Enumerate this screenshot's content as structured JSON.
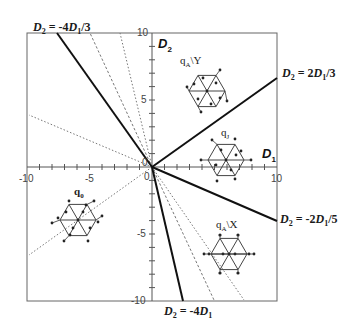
{
  "diagram": {
    "x_axis": {
      "name": "D",
      "sub": "1",
      "min": -10,
      "max": 10,
      "ticks": [
        "-10",
        "-5",
        "0",
        "10"
      ]
    },
    "y_axis": {
      "name": "D",
      "sub": "2",
      "min": -10,
      "max": 10,
      "ticks": [
        "10",
        "5",
        "0",
        "-5",
        "-10"
      ]
    },
    "boundary_lines": [
      {
        "id": "line-neg4-3",
        "label_pre": "D",
        "label_sub": "2",
        "label_mid": " = -4",
        "label_d": "D",
        "label_dsub": "1",
        "label_post": "/3",
        "slope": -1.3333,
        "style": "solid"
      },
      {
        "id": "line-2-3",
        "label_pre": "D",
        "label_sub": "2",
        "label_mid": " = 2",
        "label_d": "D",
        "label_dsub": "1",
        "label_post": "/3",
        "slope": 0.6667,
        "style": "solid"
      },
      {
        "id": "line-neg2-5",
        "label_pre": "D",
        "label_sub": "2",
        "label_mid": " = -2",
        "label_d": "D",
        "label_dsub": "1",
        "label_post": "/5",
        "slope": -0.4,
        "style": "solid"
      },
      {
        "id": "line-neg4",
        "label_pre": "D",
        "label_sub": "2",
        "label_mid": " = -4",
        "label_d": "D",
        "label_dsub": "1",
        "label_post": "",
        "slope": -4,
        "style": "solid"
      }
    ],
    "auxiliary_lines": [
      {
        "style": "dotted",
        "direction": "upper-left"
      },
      {
        "style": "dotted",
        "direction": "upper-left-steep"
      },
      {
        "style": "dashed",
        "direction": "upper-left-steep"
      },
      {
        "style": "dashed",
        "direction": "lower-right"
      },
      {
        "style": "dotted",
        "direction": "lower-right"
      },
      {
        "style": "dotted",
        "direction": "lower-left"
      }
    ],
    "regions": [
      {
        "id": "qA-Y",
        "label_main": "q",
        "label_sub": "A",
        "label_suffix": "\\Y",
        "bold": false
      },
      {
        "id": "qJ",
        "label_main": "q",
        "label_sub": "J",
        "label_suffix": "",
        "bold": false
      },
      {
        "id": "q0",
        "label_main": "q",
        "label_sub": "0",
        "label_suffix": "",
        "bold": true
      },
      {
        "id": "qA-X",
        "label_main": "q",
        "label_sub": "A",
        "label_suffix": "\\X",
        "bold": false
      }
    ]
  }
}
